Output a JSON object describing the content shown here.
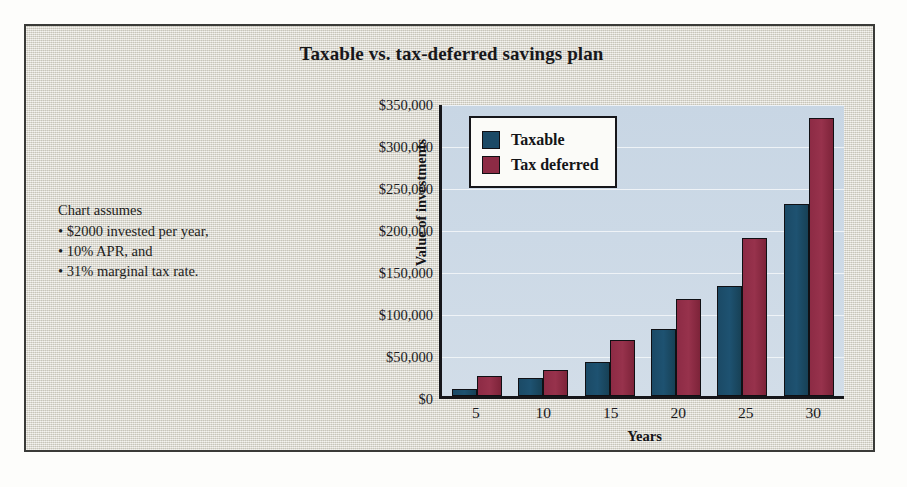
{
  "figure": {
    "title": "Taxable vs. tax-deferred savings plan",
    "background_color": "#dedbd0",
    "frame_color": "#3a3b38",
    "plot_background_color": "#ccd9e6"
  },
  "assumptions": {
    "heading": "Chart assumes",
    "bullets": [
      "• $2000 invested per year,",
      "• 10% APR, and",
      "• 31% marginal tax rate."
    ]
  },
  "legend": {
    "position": "top-left-inside-plot",
    "entries": [
      {
        "label": "Taxable",
        "color": "#1b4a66"
      },
      {
        "label": "Tax deferred",
        "color": "#8d2b45"
      }
    ]
  },
  "chart_data": {
    "type": "bar",
    "title": "Taxable vs. tax-deferred savings plan",
    "xlabel": "Years",
    "ylabel": "Value of investments",
    "categories": [
      "5",
      "10",
      "15",
      "20",
      "25",
      "30"
    ],
    "series": [
      {
        "name": "Taxable",
        "color": "#1b4a66",
        "values": [
          8000,
          21000,
          40000,
          80000,
          131000,
          229000
        ]
      },
      {
        "name": "Tax deferred",
        "color": "#8d2b45",
        "values": [
          24000,
          31000,
          67000,
          116000,
          188000,
          331000
        ]
      }
    ],
    "ylim": [
      0,
      350000
    ],
    "ytick_values": [
      0,
      50000,
      100000,
      150000,
      200000,
      250000,
      300000,
      350000
    ],
    "ytick_labels": [
      "$0",
      "$50,000",
      "$100,000",
      "$150,000",
      "$200,000",
      "$250,000",
      "$300,000",
      "$350,000"
    ],
    "xtick_labels": [
      "5",
      "10",
      "15",
      "20",
      "25",
      "30"
    ],
    "grid": true,
    "grid_axis": "y",
    "legend_position": "upper left"
  }
}
